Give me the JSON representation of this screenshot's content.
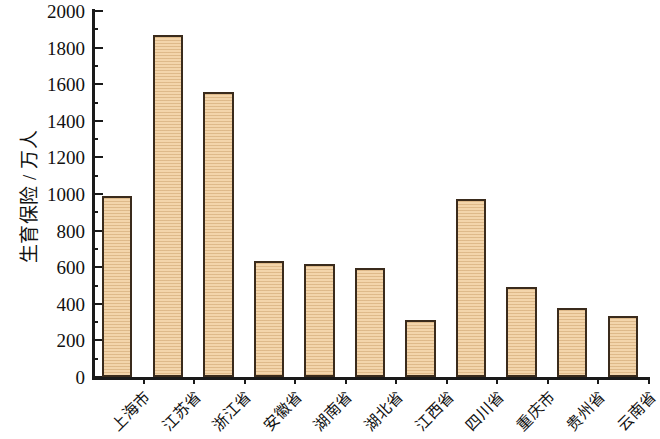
{
  "chart_data": {
    "type": "bar",
    "title": "",
    "subtitle": "",
    "xlabel": "",
    "ylabel": "生育保险 / 万人",
    "categories": [
      "上海市",
      "江苏省",
      "浙江省",
      "安徽省",
      "湖南省",
      "湖北省",
      "江西省",
      "四川省",
      "重庆市",
      "贵州省",
      "云南省"
    ],
    "values": [
      990,
      1870,
      1560,
      635,
      615,
      595,
      312,
      975,
      490,
      375,
      335
    ],
    "series": [
      {
        "name": "生育保险",
        "values": [
          990,
          1870,
          1560,
          635,
          615,
          595,
          312,
          975,
          490,
          375,
          335
        ]
      }
    ],
    "ylim": [
      0,
      2000
    ],
    "y_major_ticks": [
      0,
      200,
      400,
      600,
      800,
      1000,
      1200,
      1400,
      1600,
      1800,
      2000
    ],
    "y_tick_labels": [
      "0",
      "200",
      "400",
      "600",
      "800",
      "1000",
      "1200",
      "1400",
      "1600",
      "1800",
      "2000"
    ],
    "y_minor_tick_interval": 100,
    "grid": false,
    "legend": false,
    "legend_position": "none",
    "bar_fill_color": "#F3D5AB",
    "bar_edge_color": "#3A2B1C",
    "axis_color": "#1A1A1A",
    "background_color": "#FFFFFF",
    "x_tick_label_rotation": -45
  }
}
